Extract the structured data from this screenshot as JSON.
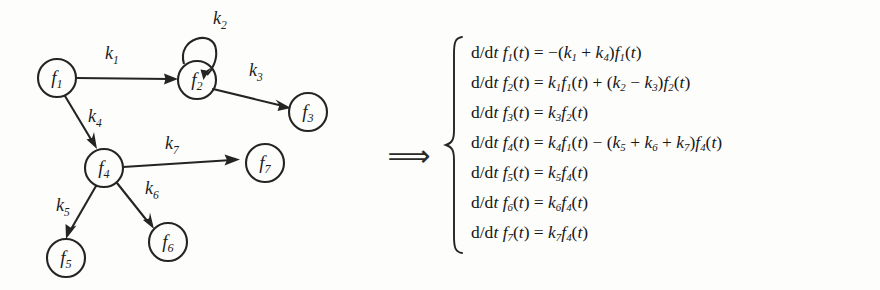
{
  "figure": {
    "type": "reaction-network-to-ode-system",
    "implication_symbol": "⟹"
  },
  "graph": {
    "nodes": [
      {
        "id": "f1",
        "label": "f",
        "subscript": "1",
        "cx": 57,
        "cy": 78,
        "r": 19
      },
      {
        "id": "f2",
        "label": "f",
        "subscript": "2",
        "cx": 197,
        "cy": 80,
        "r": 19
      },
      {
        "id": "f3",
        "label": "f",
        "subscript": "3",
        "cx": 308,
        "cy": 112,
        "r": 19
      },
      {
        "id": "f4",
        "label": "f",
        "subscript": "4",
        "cx": 104,
        "cy": 168,
        "r": 19
      },
      {
        "id": "f5",
        "label": "f",
        "subscript": "5",
        "cx": 66,
        "cy": 258,
        "r": 19
      },
      {
        "id": "f6",
        "label": "f",
        "subscript": "6",
        "cx": 168,
        "cy": 242,
        "r": 19
      },
      {
        "id": "f7",
        "label": "f",
        "subscript": "7",
        "cx": 265,
        "cy": 163,
        "r": 19
      }
    ],
    "edges": [
      {
        "id": "k1",
        "label": "k",
        "subscript": "1",
        "from": "f1",
        "to": "f2",
        "lx": 112,
        "ly": 55
      },
      {
        "id": "k2",
        "label": "k",
        "subscript": "2",
        "from": "f2",
        "to": "f2",
        "self_loop": true,
        "lx": 220,
        "ly": 20
      },
      {
        "id": "k3",
        "label": "k",
        "subscript": "3",
        "from": "f2",
        "to": "f3",
        "lx": 256,
        "ly": 72
      },
      {
        "id": "k4",
        "label": "k",
        "subscript": "4",
        "from": "f1",
        "to": "f4",
        "lx": 95,
        "ly": 118
      },
      {
        "id": "k5",
        "label": "k",
        "subscript": "5",
        "from": "f4",
        "to": "f5",
        "lx": 63,
        "ly": 207
      },
      {
        "id": "k6",
        "label": "k",
        "subscript": "6",
        "from": "f4",
        "to": "f6",
        "lx": 152,
        "ly": 190
      },
      {
        "id": "k7",
        "label": "k",
        "subscript": "7",
        "from": "f4",
        "to": "f7",
        "lx": 172,
        "ly": 145
      }
    ]
  },
  "ode_system": {
    "brace": "{",
    "equations": [
      {
        "id": "eq-f1",
        "lhs_prefix": "d/d",
        "lhs_var": "t",
        "func": "f",
        "func_sub": "1",
        "arg": "(t)",
        "rhs_plain": "= −(k1 + k4)f1(t)"
      },
      {
        "id": "eq-f2",
        "lhs_prefix": "d/d",
        "lhs_var": "t",
        "func": "f",
        "func_sub": "2",
        "arg": "(t)",
        "rhs_plain": "= k1f1(t) + (k2 − k3)f2(t)"
      },
      {
        "id": "eq-f3",
        "lhs_prefix": "d/d",
        "lhs_var": "t",
        "func": "f",
        "func_sub": "3",
        "arg": "(t)",
        "rhs_plain": "= k3f2(t)"
      },
      {
        "id": "eq-f4",
        "lhs_prefix": "d/d",
        "lhs_var": "t",
        "func": "f",
        "func_sub": "4",
        "arg": "(t)",
        "rhs_plain": "= k4f1(t) − (k5 + k6 + k7)f4(t)"
      },
      {
        "id": "eq-f5",
        "lhs_prefix": "d/d",
        "lhs_var": "t",
        "func": "f",
        "func_sub": "5",
        "arg": "(t)",
        "rhs_plain": "= k5f4(t)"
      },
      {
        "id": "eq-f6",
        "lhs_prefix": "d/d",
        "lhs_var": "t",
        "func": "f",
        "func_sub": "6",
        "arg": "(t)",
        "rhs_plain": "= k6f4(t)"
      },
      {
        "id": "eq-f7",
        "lhs_prefix": "d/d",
        "lhs_var": "t",
        "func": "f",
        "func_sub": "7",
        "arg": "(t)",
        "rhs_plain": "= k7f4(t)"
      }
    ]
  },
  "colors": {
    "ink": "#242424",
    "paper": "#fdfdfc"
  }
}
